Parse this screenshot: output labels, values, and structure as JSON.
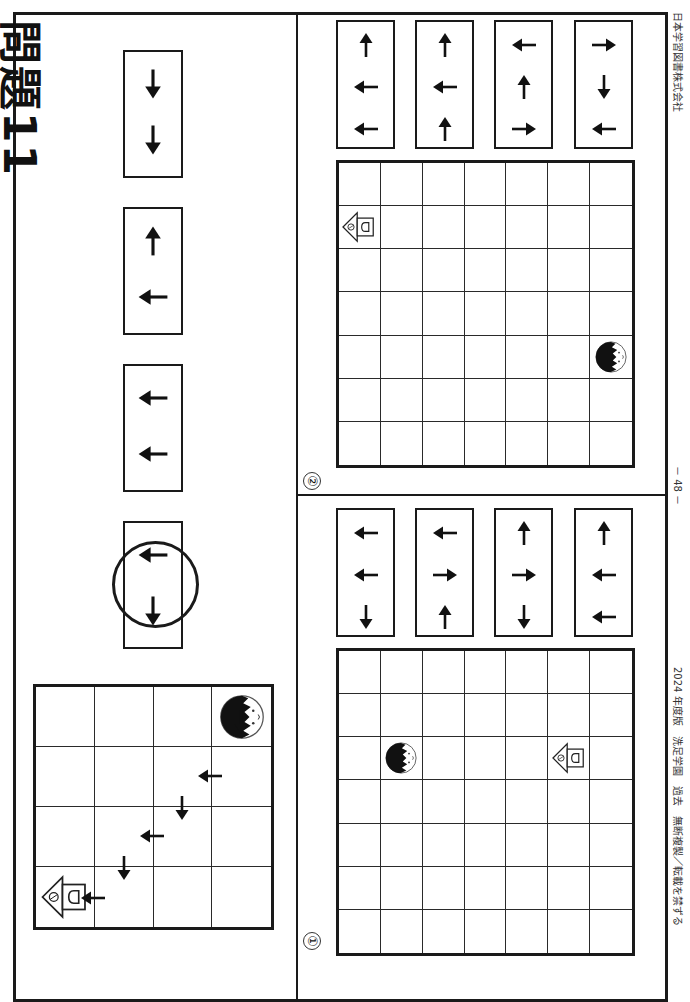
{
  "page": {
    "title": "問題11",
    "page_number": "－ 48 －",
    "footer_left": "2024 年度版　洗足学園　過去　無断複製／転載を禁ずる",
    "footer_right": "日本学習図書株式会社",
    "orientation": "rotated-90"
  },
  "example": {
    "cards": [
      {
        "arrows": [
          "down",
          "down"
        ],
        "circled": false
      },
      {
        "arrows": [
          "up",
          "left"
        ],
        "circled": false
      },
      {
        "arrows": [
          "left",
          "left"
        ],
        "circled": false
      },
      {
        "arrows": [
          "left",
          "down"
        ],
        "circled": true
      }
    ],
    "grid": {
      "rows": 4,
      "cols": 4,
      "face": {
        "row": 0,
        "col": 3
      },
      "house": {
        "row": 3,
        "col": 0
      },
      "path_arrows": [
        {
          "x": 241,
          "y": 722,
          "dir": "down"
        },
        {
          "x": 210,
          "y": 776,
          "dir": "left"
        },
        {
          "x": 182,
          "y": 808,
          "dir": "down"
        },
        {
          "x": 152,
          "y": 836,
          "dir": "left"
        },
        {
          "x": 124,
          "y": 868,
          "dir": "down"
        },
        {
          "x": 93,
          "y": 898,
          "dir": "left"
        }
      ]
    }
  },
  "problems": [
    {
      "label": "①",
      "cards": [
        {
          "arrows": [
            "left",
            "left",
            "down"
          ]
        },
        {
          "arrows": [
            "left",
            "right",
            "up"
          ]
        },
        {
          "arrows": [
            "up",
            "right",
            "down"
          ]
        },
        {
          "arrows": [
            "up",
            "left",
            "left"
          ]
        }
      ],
      "grid": {
        "rows": 7,
        "cols": 7,
        "face": {
          "row": 2,
          "col": 1
        },
        "house": {
          "row": 2,
          "col": 5
        }
      }
    },
    {
      "label": "②",
      "cards": [
        {
          "arrows": [
            "up",
            "left",
            "left"
          ]
        },
        {
          "arrows": [
            "up",
            "left",
            "up"
          ]
        },
        {
          "arrows": [
            "left",
            "up",
            "right"
          ]
        },
        {
          "arrows": [
            "right",
            "down",
            "left"
          ]
        }
      ],
      "grid": {
        "rows": 7,
        "cols": 7,
        "face": {
          "row": 4,
          "col": 6
        },
        "house": {
          "row": 1,
          "col": 0
        }
      }
    }
  ]
}
